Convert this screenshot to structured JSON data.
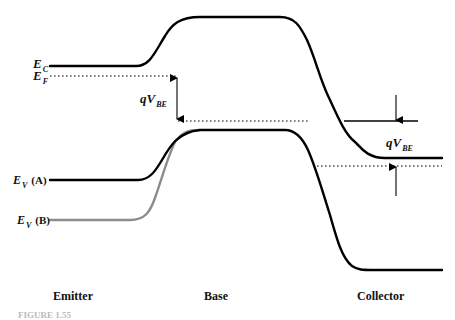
{
  "diagram": {
    "type": "band-diagram",
    "colors": {
      "band_line": "#000000",
      "band_line_alt": "#8c8c8c",
      "fermi_line": "#000000",
      "background": "#ffffff"
    },
    "labels": {
      "ec": {
        "main": "E",
        "sub": "C"
      },
      "ef": {
        "main": "E",
        "sub": "F"
      },
      "ev_a": {
        "main": "E",
        "sub": "V",
        "tag": "(A)"
      },
      "ev_b": {
        "main": "E",
        "sub": "V",
        "tag": "(B)"
      },
      "qvbe_left": {
        "main": "qV",
        "sub": "BE"
      },
      "qvbe_right": {
        "main": "qV",
        "sub": "BE"
      }
    },
    "regions": [
      {
        "name": "Emitter"
      },
      {
        "name": "Base"
      },
      {
        "name": "Collector"
      }
    ],
    "caption": "FIGURE 1.55"
  }
}
